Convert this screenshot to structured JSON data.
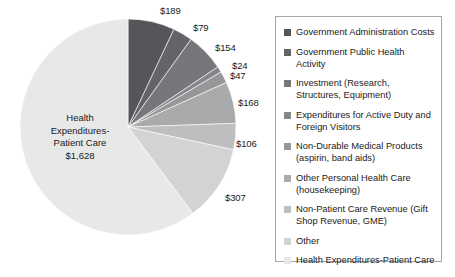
{
  "chart_data": {
    "type": "pie",
    "title": "",
    "currency_symbol": "$",
    "units": "billions of dollars",
    "total": 2702,
    "start_angle_deg": 0,
    "direction": "clockwise",
    "legend_position": "right",
    "legend_border_color": "#a6a6a6",
    "categories": [
      "Government  Administration Costs",
      "Government Public Health Activity",
      "Investment (Research, Structures, Equipment)",
      "Expenditures for Active Duty and Foreign Visitors",
      "Non-Durable Medical Products (aspirin, band aids)",
      "Other Personal Health Care (housekeeping)",
      "Non-Patient Care Revenue (Gift Shop Revenue, GME)",
      "Other",
      "Health Expenditures-Patient Care"
    ],
    "values": [
      189,
      79,
      154,
      24,
      47,
      168,
      106,
      307,
      1628
    ],
    "value_labels": [
      "$189",
      "$79",
      "$154",
      "$24",
      "$47",
      "$168",
      "$106",
      "$307",
      "$1,628"
    ],
    "colors": [
      "#55565a",
      "#636468",
      "#76777b",
      "#85868a",
      "#969799",
      "#a9aaac",
      "#bdbec0",
      "#d2d3d4",
      "#e7e8e8"
    ]
  },
  "legend": {
    "items": [
      {
        "label": "Government  Administration Costs",
        "color": "#55565a"
      },
      {
        "label": "Government Public Health Activity",
        "color": "#636468"
      },
      {
        "label": "Investment (Research, Structures, Equipment)",
        "color": "#76777b"
      },
      {
        "label": "Expenditures for Active Duty and Foreign Visitors",
        "color": "#85868a"
      },
      {
        "label": "Non-Durable Medical Products (aspirin, band aids)",
        "color": "#969799"
      },
      {
        "label": "Other Personal Health Care (housekeeping)",
        "color": "#a9aaac"
      },
      {
        "label": "Non-Patient Care Revenue (Gift Shop Revenue, GME)",
        "color": "#bdbec0"
      },
      {
        "label": "Other",
        "color": "#d2d3d4"
      },
      {
        "label": "Health Expenditures-Patient Care",
        "color": "#e7e8e8"
      }
    ]
  },
  "center_label": {
    "line1": "Health",
    "line2": "Expenditures-",
    "line3": "Patient Care",
    "line4": "$1,628"
  },
  "callouts": [
    {
      "text": "$189",
      "x": 160,
      "y": 5
    },
    {
      "text": "$79",
      "x": 193,
      "y": 22
    },
    {
      "text": "$154",
      "x": 215,
      "y": 42
    },
    {
      "text": "$24",
      "x": 232,
      "y": 60
    },
    {
      "text": "$47",
      "x": 230,
      "y": 70
    },
    {
      "text": "$168",
      "x": 238,
      "y": 97
    },
    {
      "text": "$106",
      "x": 236,
      "y": 138
    },
    {
      "text": "$307",
      "x": 225,
      "y": 192
    }
  ]
}
